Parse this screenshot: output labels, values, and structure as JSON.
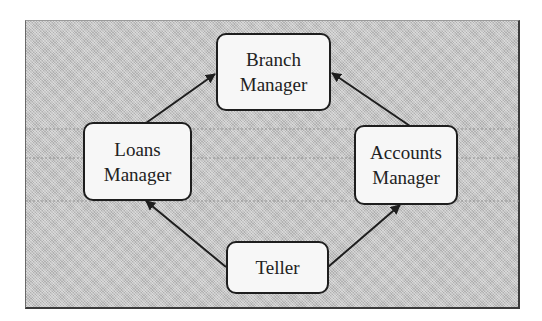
{
  "diagram": {
    "type": "organizational-hierarchy",
    "colors": {
      "panel_background": "#c4c4c4",
      "node_fill": "#f7f7f7",
      "node_border": "#1e1e1e",
      "arrow": "#1e1e1e",
      "text": "#222222"
    },
    "nodes": {
      "branch_manager": {
        "line1": "Branch",
        "line2": "Manager"
      },
      "loans_manager": {
        "line1": "Loans",
        "line2": "Manager"
      },
      "accounts_manager": {
        "line1": "Accounts",
        "line2": "Manager"
      },
      "teller": {
        "line1": "Teller"
      }
    },
    "edges": [
      {
        "from": "Loans Manager",
        "to": "Branch Manager"
      },
      {
        "from": "Accounts Manager",
        "to": "Branch Manager"
      },
      {
        "from": "Teller",
        "to": "Loans Manager"
      },
      {
        "from": "Teller",
        "to": "Accounts Manager"
      }
    ]
  }
}
